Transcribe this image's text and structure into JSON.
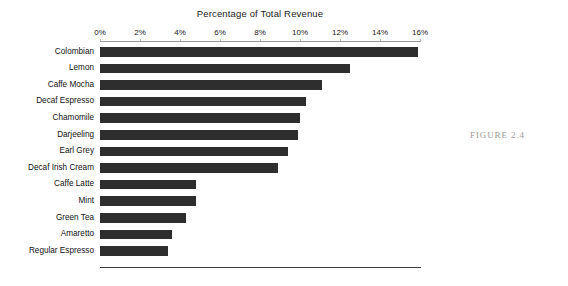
{
  "figure": {
    "caption": "FIGURE 2.4"
  },
  "chart_data": {
    "type": "bar",
    "orientation": "horizontal",
    "title": "Percentage of Total Revenue",
    "xlabel": "",
    "ylabel": "",
    "xlim": [
      0,
      16
    ],
    "xticks": [
      0,
      2,
      4,
      6,
      8,
      10,
      12,
      14,
      16
    ],
    "xticklabels": [
      "0%",
      "2%",
      "4%",
      "6%",
      "8%",
      "10%",
      "12%",
      "14%",
      "16%"
    ],
    "grid": false,
    "legend": null,
    "bar_color": "#2e2e2e",
    "categories": [
      "Colombian",
      "Lemon",
      "Caffe Mocha",
      "Decaf Espresso",
      "Chamomile",
      "Darjeeling",
      "Earl Grey",
      "Decaf Irish Cream",
      "Caffe Latte",
      "Mint",
      "Green Tea",
      "Amaretto",
      "Regular Espresso"
    ],
    "values": [
      15.9,
      12.5,
      11.1,
      10.3,
      10.0,
      9.9,
      9.4,
      8.9,
      4.8,
      4.8,
      4.3,
      3.6,
      3.4
    ]
  }
}
